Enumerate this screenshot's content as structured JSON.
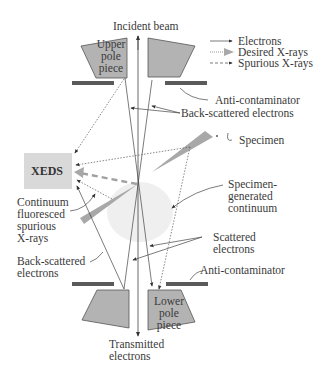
{
  "diagram": {
    "labels": {
      "incident_beam": "Incident beam",
      "upper_pole_line1": "Upper",
      "upper_pole_line2": "pole",
      "upper_pole_line3": "piece",
      "lower_pole_line1": "Lower",
      "lower_pole_line2": "pole",
      "lower_pole_line3": "piece",
      "anti_contaminator_top": "Anti-contaminator",
      "anti_contaminator_bottom": "Anti-contaminator",
      "backscattered_top": "Back-scattered electrons",
      "backscattered_left_line1": "Back-scattered",
      "backscattered_left_line2": "electrons",
      "specimen": "Specimen",
      "xeds": "XEDS",
      "continuum_line1": "Continuum",
      "continuum_line2": "fluoresced",
      "continuum_line3": "spurious",
      "continuum_line4": "X-rays",
      "specimen_gen_line1": "Specimen-",
      "specimen_gen_line2": "generated",
      "specimen_gen_line3": "continuum",
      "scattered_line1": "Scattered",
      "scattered_line2": "electrons",
      "transmitted_line1": "Transmitted",
      "transmitted_line2": "electrons"
    },
    "legend": [
      {
        "label": "Electrons",
        "style": "solid-arrow"
      },
      {
        "label": "Desired X-rays",
        "style": "dotted-gray-arrow"
      },
      {
        "label": "Spurious X-rays",
        "style": "dashed-arrow"
      }
    ],
    "colors": {
      "pole_piece": "#b0b0b0",
      "anti_contaminator": "#5a5a5a",
      "xeds_box": "#d9d9d9",
      "specimen": "#a8a8a8",
      "continuum_blob": "#eeeeee",
      "lines": "#444444",
      "desired_xray": "#aaaaaa"
    }
  }
}
